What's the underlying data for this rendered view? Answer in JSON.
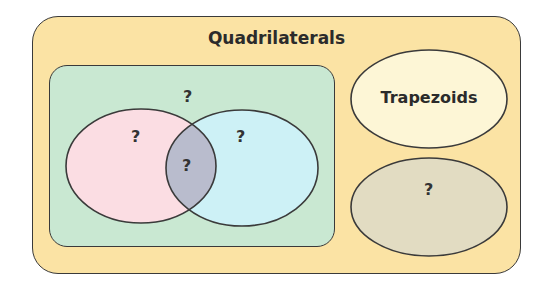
{
  "diagram": {
    "title": "Quadrilaterals",
    "inner_set": {
      "label": "?"
    },
    "left_circle": {
      "label": "?",
      "color": "#fbdde3"
    },
    "right_circle": {
      "label": "?",
      "color": "#cdf1f6"
    },
    "intersection": {
      "label": "?",
      "color": "#b9bccd"
    },
    "trapezoids": {
      "label": "Trapezoids",
      "color": "#fdf6d6"
    },
    "other_set": {
      "label": "?",
      "color": "#e2dcc2"
    },
    "colors": {
      "outer_fill": "#fbe3a4",
      "inner_fill": "#c9e8d2",
      "stroke": "#3a3a3a"
    }
  }
}
